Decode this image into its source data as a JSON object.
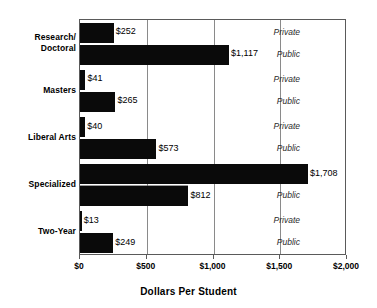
{
  "chart_data": {
    "type": "bar",
    "orientation": "horizontal",
    "title": "",
    "xlabel": "Dollars Per Student",
    "ylabel": "",
    "xlim": [
      0,
      2000
    ],
    "xticks": [
      0,
      500,
      1000,
      1500,
      2000
    ],
    "xtick_labels": [
      "$0",
      "$500",
      "$1,000",
      "$1,500",
      "$2,000"
    ],
    "grid": true,
    "legend": "inline-right-labels",
    "categories": [
      "Research/\nDoctoral",
      "Masters",
      "Liberal Arts",
      "Specialized",
      "Two-Year"
    ],
    "series": [
      {
        "name": "Private",
        "values": [
          252,
          41,
          40,
          1708,
          13
        ]
      },
      {
        "name": "Public",
        "values": [
          1117,
          265,
          573,
          812,
          249
        ]
      }
    ],
    "bars": [
      {
        "category": "Research/\nDoctoral",
        "sector": "Private",
        "value": 252,
        "value_label": "$252",
        "sector_label": "Private"
      },
      {
        "category": "Research/\nDoctoral",
        "sector": "Public",
        "value": 1117,
        "value_label": "$1,117",
        "sector_label": "Public"
      },
      {
        "category": "Masters",
        "sector": "Private",
        "value": 41,
        "value_label": "$41",
        "sector_label": "Private"
      },
      {
        "category": "Masters",
        "sector": "Public",
        "value": 265,
        "value_label": "$265",
        "sector_label": "Public"
      },
      {
        "category": "Liberal Arts",
        "sector": "Private",
        "value": 40,
        "value_label": "$40",
        "sector_label": "Private"
      },
      {
        "category": "Liberal Arts",
        "sector": "Public",
        "value": 573,
        "value_label": "$573",
        "sector_label": "Public"
      },
      {
        "category": "Specialized",
        "sector": "Private",
        "value": 1708,
        "value_label": "$1,708",
        "sector_label": ""
      },
      {
        "category": "Specialized",
        "sector": "Public",
        "value": 812,
        "value_label": "$812",
        "sector_label": "Public"
      },
      {
        "category": "Two-Year",
        "sector": "Private",
        "value": 13,
        "value_label": "$13",
        "sector_label": "Private"
      },
      {
        "category": "Two-Year",
        "sector": "Public",
        "value": 249,
        "value_label": "$249",
        "sector_label": "Public"
      }
    ],
    "colors": {
      "bar": "#0a0a0a",
      "grid": "#8a8a8a",
      "frame": "#5a5a5a",
      "text": "#000000"
    }
  },
  "axis": {
    "xtick_labels": [
      "$0",
      "$500",
      "$1,000",
      "$1,500",
      "$2,000"
    ],
    "title": "Dollars Per Student"
  },
  "cats": [
    {
      "label": "Research/\nDoctoral"
    },
    {
      "label": "Masters"
    },
    {
      "label": "Liberal Arts"
    },
    {
      "label": "Specialized"
    },
    {
      "label": "Two-Year"
    }
  ]
}
